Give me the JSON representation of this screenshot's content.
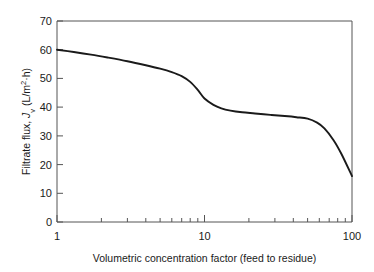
{
  "chart_data": {
    "type": "line",
    "title": "",
    "xlabel": "Volumetric concentration factor (feed to residue)",
    "ylabel": "Filtrate flux, Jv (L/m2·h)",
    "ylabel_main": "Filtrate flux, ",
    "ylabel_symbol": "J",
    "ylabel_subscript": "v",
    "ylabel_units": " (L/m",
    "ylabel_units_exp": "2",
    "ylabel_units_tail": "·h)",
    "xscale": "log",
    "yscale": "linear",
    "xlim": [
      1,
      100
    ],
    "ylim": [
      0,
      70
    ],
    "grid": false,
    "legend": false,
    "x_tick_labels": [
      "1",
      "10",
      "100"
    ],
    "x_tick_values": [
      1,
      10,
      100
    ],
    "x_minor_ticks": [
      2,
      3,
      4,
      5,
      6,
      7,
      8,
      9,
      20,
      30,
      40,
      50,
      60,
      70,
      80,
      90
    ],
    "y_tick_labels": [
      "0",
      "10",
      "20",
      "30",
      "40",
      "50",
      "60",
      "70"
    ],
    "y_tick_values": [
      0,
      10,
      20,
      30,
      40,
      50,
      60,
      70
    ],
    "series": [
      {
        "name": "Filtrate flux",
        "color": "#1a1a1a",
        "x": [
          1.0,
          1.3,
          1.7,
          2.2,
          3.0,
          4.0,
          5.0,
          6.0,
          7.0,
          8.0,
          9.0,
          10.0,
          11.5,
          13.0,
          15.0,
          18.0,
          22.0,
          28.0,
          35.0,
          42.0,
          50.0,
          58.0,
          65.0,
          75.0,
          85.0,
          100.0
        ],
        "values": [
          60.0,
          59.2,
          58.3,
          57.3,
          56.0,
          54.6,
          53.4,
          52.2,
          50.8,
          48.8,
          46.0,
          43.0,
          40.8,
          39.6,
          38.8,
          38.2,
          37.8,
          37.3,
          36.9,
          36.5,
          36.0,
          34.6,
          32.6,
          28.5,
          23.6,
          16.0
        ]
      }
    ],
    "annotations": []
  },
  "axis_color": "#555555",
  "text_color": "#1a1a1a",
  "background_color": "#ffffff"
}
